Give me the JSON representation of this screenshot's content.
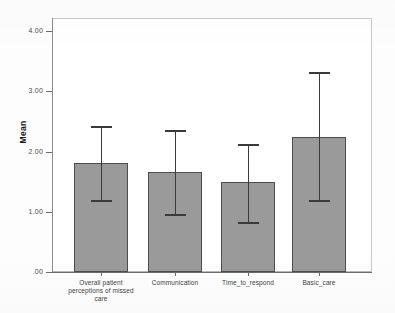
{
  "chart_data": {
    "type": "bar",
    "title": "",
    "subtitle": "",
    "xlabel": "",
    "ylabel": "Mean",
    "ylim": [
      0,
      4
    ],
    "grid": false,
    "legend": "none",
    "ytick_labels": [
      "4.00",
      "3.00",
      "2.00",
      "1.00",
      ".00"
    ],
    "ytick_values": [
      4.0,
      3.0,
      2.0,
      1.0,
      0.0
    ],
    "categories": [
      "Overall patient perceptions of missed care",
      "Communication",
      "Time_to_respond",
      "Basic_care"
    ],
    "category_label_lines": [
      [
        "Overall patient",
        "perceptions of missed",
        "care"
      ],
      [
        "Communication"
      ],
      [
        "Time_to_respond"
      ],
      [
        "Basic_care"
      ]
    ],
    "values": [
      1.81,
      1.66,
      1.49,
      2.24
    ],
    "error_bars": {
      "type": "95% CI",
      "upper": [
        2.41,
        2.34,
        2.11,
        3.3
      ],
      "lower": [
        1.18,
        0.95,
        0.81,
        1.18
      ]
    },
    "bar_color": "#9a9a9a",
    "bar_border_color": "#4d4d4d",
    "error_bar_color": "#3a3a3a",
    "axis_color": "#6b6b6b",
    "frame_color": "#b8b8b8",
    "background_color": "#ffffff"
  }
}
